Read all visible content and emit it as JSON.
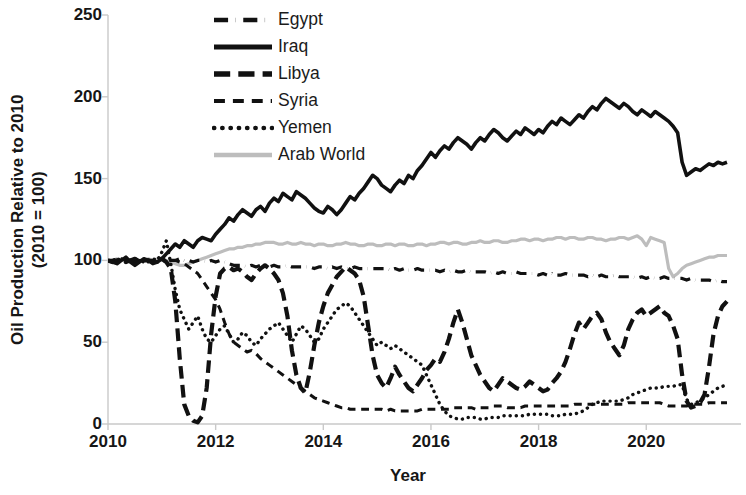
{
  "chart_data": {
    "type": "line",
    "title": "",
    "xlabel": "Year",
    "ylabel": "Oil Production Relative to 2010 (2010 = 100)",
    "ylabel_line1": "Oil Production Relative to 2010",
    "ylabel_line2": "(2010 = 100)",
    "xlim": [
      2010.0,
      2021.5
    ],
    "ylim": [
      0,
      250
    ],
    "yticks": [
      0,
      50,
      100,
      150,
      200,
      250
    ],
    "xticks": [
      2010,
      2012,
      2014,
      2016,
      2018,
      2020
    ],
    "xtick_labels": [
      "2010",
      "2012",
      "2014",
      "2016",
      "2018",
      "2020"
    ],
    "ytick_labels": [
      "0",
      "50",
      "100",
      "150",
      "200",
      "250"
    ],
    "grid": false,
    "legend_position": "top-center",
    "x_start": 2010.0,
    "x_step": 0.08333,
    "series": [
      {
        "name": "Egypt",
        "style": "dashdot",
        "color": "#111111",
        "width": 3.2,
        "values": [
          100,
          100,
          100,
          99,
          100,
          100,
          99,
          100,
          99,
          100,
          100,
          99,
          100,
          99,
          100,
          100,
          101,
          100,
          100,
          99,
          100,
          100,
          99,
          100,
          99,
          100,
          99,
          98,
          97,
          97,
          97,
          96,
          97,
          96,
          97,
          96,
          96,
          97,
          96,
          96,
          97,
          96,
          96,
          96,
          96,
          96,
          95,
          96,
          96,
          95,
          96,
          95,
          96,
          95,
          95,
          96,
          95,
          95,
          95,
          95,
          95,
          95,
          95,
          94,
          95,
          94,
          95,
          94,
          94,
          95,
          94,
          94,
          94,
          94,
          93,
          94,
          93,
          94,
          93,
          93,
          94,
          93,
          93,
          93,
          93,
          92,
          93,
          92,
          93,
          92,
          92,
          93,
          92,
          92,
          92,
          92,
          91,
          92,
          91,
          92,
          91,
          91,
          92,
          91,
          91,
          91,
          91,
          90,
          91,
          90,
          91,
          90,
          90,
          91,
          90,
          90,
          90,
          90,
          89,
          90,
          89,
          90,
          89,
          89,
          90,
          89,
          89,
          89,
          89,
          88,
          89,
          88,
          88,
          88,
          88,
          87,
          88,
          87,
          87
        ]
      },
      {
        "name": "Iraq",
        "style": "solid",
        "color": "#111111",
        "width": 3.6,
        "values": [
          100,
          99,
          98,
          100,
          102,
          99,
          97,
          99,
          101,
          100,
          98,
          99,
          101,
          104,
          107,
          110,
          108,
          112,
          110,
          108,
          112,
          114,
          113,
          112,
          116,
          119,
          122,
          126,
          124,
          128,
          131,
          129,
          127,
          131,
          133,
          130,
          135,
          138,
          136,
          141,
          139,
          137,
          142,
          140,
          138,
          135,
          132,
          130,
          129,
          133,
          131,
          128,
          131,
          135,
          139,
          137,
          141,
          144,
          148,
          152,
          150,
          146,
          144,
          142,
          146,
          149,
          147,
          152,
          150,
          155,
          158,
          162,
          166,
          163,
          167,
          170,
          168,
          172,
          175,
          173,
          171,
          168,
          172,
          175,
          173,
          177,
          180,
          178,
          175,
          173,
          176,
          179,
          177,
          181,
          179,
          177,
          180,
          178,
          182,
          185,
          183,
          187,
          185,
          183,
          186,
          189,
          187,
          191,
          194,
          192,
          196,
          199,
          197,
          195,
          193,
          196,
          194,
          191,
          189,
          192,
          190,
          188,
          191,
          189,
          187,
          185,
          182,
          178,
          160,
          152,
          154,
          156,
          155,
          157,
          159,
          158,
          160,
          159,
          160
        ]
      },
      {
        "name": "Libya",
        "style": "dash",
        "color": "#111111",
        "width": 4.2,
        "values": [
          100,
          99,
          100,
          101,
          99,
          100,
          101,
          99,
          100,
          100,
          99,
          100,
          101,
          99,
          95,
          75,
          40,
          12,
          5,
          2,
          1,
          5,
          22,
          55,
          78,
          92,
          95,
          96,
          94,
          95,
          93,
          90,
          88,
          92,
          95,
          97,
          95,
          92,
          88,
          80,
          66,
          45,
          30,
          22,
          19,
          32,
          48,
          62,
          72,
          80,
          85,
          90,
          93,
          96,
          94,
          92,
          88,
          78,
          60,
          42,
          30,
          25,
          22,
          28,
          35,
          30,
          26,
          22,
          20,
          24,
          28,
          33,
          36,
          40,
          38,
          44,
          52,
          62,
          70,
          62,
          52,
          42,
          36,
          30,
          26,
          22,
          20,
          24,
          28,
          26,
          24,
          22,
          21,
          23,
          26,
          24,
          22,
          20,
          21,
          25,
          28,
          32,
          38,
          46,
          55,
          62,
          58,
          62,
          66,
          68,
          64,
          56,
          50,
          46,
          42,
          48,
          58,
          64,
          68,
          70,
          66,
          68,
          70,
          72,
          68,
          66,
          60,
          52,
          30,
          14,
          10,
          11,
          13,
          18,
          35,
          55,
          66,
          72,
          75
        ]
      },
      {
        "name": "Syria",
        "style": "smalldash",
        "color": "#111111",
        "width": 3.0,
        "values": [
          100,
          100,
          100,
          101,
          100,
          100,
          99,
          100,
          100,
          99,
          100,
          100,
          101,
          99,
          100,
          100,
          99,
          98,
          96,
          94,
          92,
          88,
          84,
          80,
          76,
          70,
          62,
          55,
          50,
          48,
          46,
          44,
          45,
          43,
          40,
          38,
          36,
          34,
          32,
          30,
          28,
          26,
          24,
          22,
          20,
          18,
          16,
          15,
          14,
          13,
          12,
          11,
          10,
          10,
          9,
          9,
          9,
          9,
          9,
          9,
          9,
          9,
          8,
          9,
          8,
          8,
          8,
          8,
          8,
          8,
          9,
          9,
          9,
          9,
          9,
          9,
          9,
          10,
          10,
          10,
          10,
          10,
          9,
          10,
          10,
          10,
          11,
          11,
          11,
          10,
          10,
          10,
          10,
          11,
          11,
          11,
          11,
          11,
          11,
          11,
          11,
          11,
          11,
          11,
          12,
          12,
          12,
          12,
          12,
          12,
          12,
          12,
          12,
          12,
          12,
          12,
          13,
          13,
          13,
          13,
          13,
          13,
          13,
          13,
          12,
          11,
          11,
          11,
          11,
          11,
          12,
          12,
          12,
          12,
          13,
          13,
          13,
          13,
          13
        ]
      },
      {
        "name": "Yemen",
        "style": "dot",
        "color": "#111111",
        "width": 3.4,
        "values": [
          100,
          100,
          101,
          100,
          99,
          100,
          101,
          100,
          99,
          100,
          101,
          100,
          105,
          112,
          98,
          82,
          70,
          64,
          58,
          62,
          66,
          58,
          52,
          50,
          54,
          58,
          60,
          55,
          50,
          52,
          56,
          54,
          50,
          48,
          52,
          55,
          58,
          60,
          62,
          58,
          54,
          50,
          55,
          60,
          58,
          54,
          50,
          52,
          58,
          62,
          66,
          70,
          72,
          74,
          72,
          68,
          64,
          60,
          56,
          52,
          48,
          50,
          48,
          46,
          48,
          46,
          44,
          42,
          40,
          38,
          36,
          30,
          24,
          18,
          12,
          8,
          5,
          4,
          3,
          3,
          4,
          4,
          4,
          3,
          3,
          4,
          4,
          4,
          5,
          5,
          5,
          5,
          5,
          5,
          6,
          6,
          6,
          6,
          6,
          5,
          5,
          5,
          6,
          6,
          6,
          7,
          8,
          10,
          12,
          13,
          14,
          14,
          14,
          14,
          14,
          15,
          16,
          18,
          19,
          20,
          21,
          22,
          22,
          22,
          23,
          23,
          23,
          24,
          24,
          15,
          12,
          13,
          14,
          16,
          18,
          20,
          22,
          23,
          24
        ]
      },
      {
        "name": "Arab World",
        "style": "solid",
        "color": "#bdbdbd",
        "width": 3.2,
        "values": [
          100,
          100,
          101,
          100,
          101,
          100,
          101,
          100,
          100,
          101,
          100,
          101,
          101,
          100,
          99,
          98,
          97,
          97,
          98,
          99,
          100,
          101,
          102,
          103,
          104,
          105,
          106,
          107,
          107,
          108,
          108,
          109,
          109,
          110,
          110,
          111,
          111,
          111,
          110,
          110,
          111,
          110,
          110,
          111,
          110,
          110,
          109,
          110,
          110,
          109,
          109,
          110,
          110,
          111,
          110,
          110,
          109,
          109,
          110,
          110,
          109,
          109,
          110,
          110,
          109,
          110,
          110,
          109,
          109,
          110,
          110,
          109,
          110,
          110,
          111,
          111,
          110,
          111,
          111,
          110,
          110,
          111,
          111,
          112,
          111,
          111,
          112,
          112,
          111,
          111,
          112,
          112,
          113,
          113,
          112,
          113,
          113,
          112,
          113,
          113,
          114,
          114,
          113,
          114,
          114,
          113,
          113,
          114,
          114,
          113,
          113,
          112,
          113,
          113,
          114,
          114,
          113,
          114,
          115,
          113,
          109,
          114,
          113,
          112,
          111,
          95,
          90,
          92,
          95,
          97,
          98,
          99,
          100,
          101,
          102,
          102,
          103,
          103,
          103
        ]
      }
    ]
  },
  "legend": {
    "items": [
      {
        "label": "Egypt",
        "style": "dashdot",
        "color": "#111111"
      },
      {
        "label": "Iraq",
        "style": "solid",
        "color": "#111111"
      },
      {
        "label": "Libya",
        "style": "dash",
        "color": "#111111"
      },
      {
        "label": "Syria",
        "style": "smalldash",
        "color": "#111111"
      },
      {
        "label": "Yemen",
        "style": "dot",
        "color": "#111111"
      },
      {
        "label": "Arab World",
        "style": "solid",
        "color": "#bdbdbd"
      }
    ]
  }
}
